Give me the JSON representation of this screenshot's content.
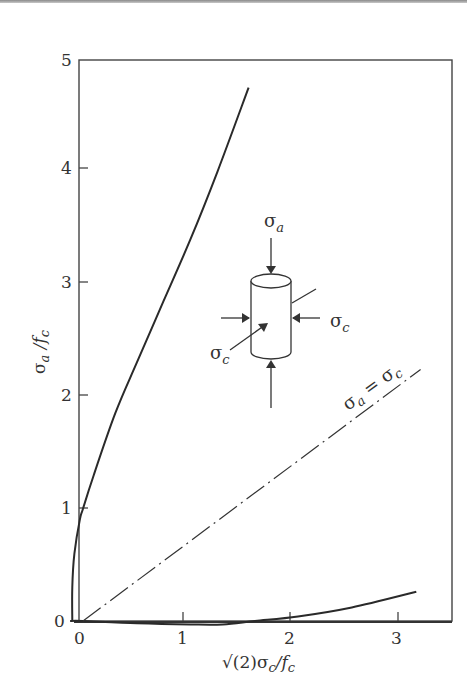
{
  "chart_data": {
    "type": "line",
    "title": "",
    "xlabel": "√(2)σc/fc",
    "ylabel": "σa/fc",
    "xlim": [
      0,
      3.3
    ],
    "ylim": [
      0,
      5
    ],
    "x_ticks": [
      "0",
      "1",
      "2",
      "3"
    ],
    "y_ticks": [
      "0",
      "1",
      "2",
      "3",
      "4",
      "5"
    ],
    "grid": false,
    "series": [
      {
        "name": "compression meridian (upper failure curve)",
        "style": "solid",
        "points": [
          [
            -0.1,
            0.0
          ],
          [
            -0.1,
            0.3
          ],
          [
            -0.08,
            0.6
          ],
          [
            -0.03,
            0.9
          ],
          [
            0.0,
            1.0
          ],
          [
            0.1,
            1.3
          ],
          [
            0.3,
            1.85
          ],
          [
            0.5,
            2.3
          ],
          [
            0.75,
            2.85
          ],
          [
            1.0,
            3.4
          ],
          [
            1.25,
            4.0
          ],
          [
            1.54,
            4.75
          ]
        ]
      },
      {
        "name": "tension meridian (lower failure curve)",
        "style": "solid",
        "points": [
          [
            -0.12,
            0.0
          ],
          [
            0.0,
            0.0
          ],
          [
            0.5,
            -0.02
          ],
          [
            1.0,
            -0.03
          ],
          [
            1.3,
            -0.03
          ],
          [
            1.6,
            0.0
          ],
          [
            2.0,
            0.04
          ],
          [
            2.5,
            0.12
          ],
          [
            3.1,
            0.26
          ]
        ]
      },
      {
        "name": "σa = σc (hydrostatic axis)",
        "style": "dashdot",
        "points": [
          [
            0.0,
            0.0
          ],
          [
            3.14,
            2.24
          ]
        ]
      }
    ],
    "annotations": [
      {
        "text": "σa = σc",
        "position": "along dash-dot line near x≈2.7"
      },
      {
        "text": "σa",
        "position": "axial load arrow above cylinder"
      },
      {
        "text": "σc",
        "position": "lateral load arrows on cylinder (right and front-left)"
      }
    ]
  },
  "labels": {
    "x_ticks": [
      "0",
      "1",
      "2",
      "3"
    ],
    "y_ticks": [
      "0",
      "1",
      "2",
      "3",
      "4",
      "5"
    ],
    "xlabel_main": "√(2)σ",
    "xlabel_sub": "c",
    "xlabel_tail": "/f",
    "xlabel_tail_sub": "c",
    "ylabel_main": "σ",
    "ylabel_sub": "a",
    "ylabel_mid": " /f",
    "ylabel_sub2": "c",
    "line_label_sigma1": "σ",
    "line_label_sub1": "a",
    "line_label_eq": " = ",
    "line_label_sigma2": "σ",
    "line_label_sub2": "c",
    "inset_axial_sigma": "σ",
    "inset_axial_sub": "a",
    "inset_lateral_right_sigma": "σ",
    "inset_lateral_right_sub": "c",
    "inset_lateral_front_sigma": "σ",
    "inset_lateral_front_sub": "c"
  }
}
